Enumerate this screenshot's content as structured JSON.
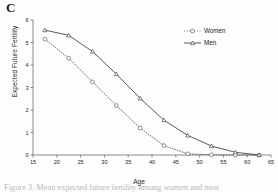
{
  "panel": {
    "label": "C"
  },
  "caption": {
    "text": "Figure 3. Mean expected future fertility among women and men"
  },
  "chart_data": {
    "type": "line",
    "title": "",
    "xlabel": "Age",
    "ylabel": "Expected Future Fertility",
    "xlim": [
      15,
      65
    ],
    "ylim": [
      0,
      6
    ],
    "xticks": [
      15,
      20,
      25,
      30,
      35,
      40,
      45,
      50,
      55,
      60,
      65
    ],
    "yticks": [
      0,
      1,
      2,
      3,
      4,
      5,
      6
    ],
    "grid": false,
    "legend_position": "top-right",
    "x": [
      17.5,
      22.5,
      27.5,
      32.5,
      37.5,
      42.5,
      47.5,
      52.5,
      57.5,
      62.5
    ],
    "series": [
      {
        "name": "Women",
        "line_style": "dotted",
        "marker": "open-circle",
        "color": "#555555",
        "values": [
          5.15,
          4.3,
          3.25,
          2.2,
          1.2,
          0.42,
          0.05,
          0.01,
          0.0,
          0.0
        ]
      },
      {
        "name": "Men",
        "line_style": "solid",
        "marker": "open-triangle",
        "color": "#3b3b3b",
        "values": [
          5.55,
          5.32,
          4.6,
          3.6,
          2.52,
          1.55,
          0.87,
          0.4,
          0.12,
          0.0
        ]
      }
    ]
  }
}
